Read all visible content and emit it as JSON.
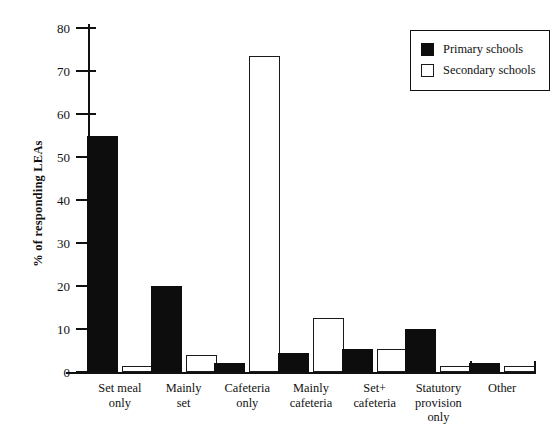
{
  "chart_data": {
    "type": "bar",
    "title": "",
    "xlabel": "",
    "ylabel": "% of responding LEAs",
    "ylim": [
      0,
      80
    ],
    "yticks": [
      0,
      10,
      20,
      30,
      40,
      50,
      60,
      70,
      80
    ],
    "ytick_labels": [
      "0",
      "10",
      "20",
      "30",
      "40",
      "50",
      "60",
      "70",
      "80"
    ],
    "grid": false,
    "legend_position": "top-right",
    "categories": [
      "Set meal\nonly",
      "Mainly\nset",
      "Cafeteria\nonly",
      "Mainly\ncafeteria",
      "Set+\ncafeteria",
      "Statutory\nprovision\nonly",
      "Other"
    ],
    "series": [
      {
        "name": "Primary schools",
        "color": "#0d0d0d",
        "fill": "solid",
        "values": [
          55,
          20,
          2,
          4.4,
          5.3,
          10,
          2
        ]
      },
      {
        "name": "Secondary schools",
        "color": "#ffffff",
        "fill": "outline",
        "values": [
          1.5,
          4,
          73.5,
          12.6,
          5.3,
          1.3,
          1.3
        ]
      }
    ]
  },
  "legend": {
    "items": [
      {
        "label": "Primary schools",
        "swatch": "filled-black-square"
      },
      {
        "label": "Secondary schools",
        "swatch": "outline-white-square"
      }
    ]
  },
  "axis": {
    "y_title": "% of responding LEAs"
  },
  "colors": {
    "primary_series": "#0d0d0d",
    "secondary_series": "#ffffff",
    "axis": "#111111",
    "background": "#ffffff"
  }
}
